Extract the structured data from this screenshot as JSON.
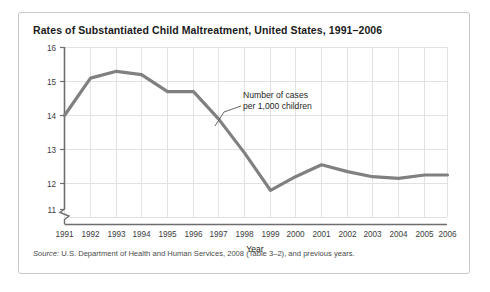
{
  "figure": {
    "title": "Rates of Substantiated Child Maltreatment, United States, 1991–2006",
    "source_label": "Source:",
    "source_text": " U.S. Department of Health and Human Services, 2008 (Table 3–2), and previous years.",
    "frame_color": "#c8c8c8",
    "background": "#ffffff"
  },
  "chart_data": {
    "type": "line",
    "title": "Rates of Substantiated Child Maltreatment, United States, 1991–2006",
    "xlabel": "Year",
    "ylabel": "",
    "categories": [
      "1991",
      "1992",
      "1993",
      "1994",
      "1995",
      "1996",
      "1997",
      "1998",
      "1999",
      "2000",
      "2001",
      "2002",
      "2003",
      "2004",
      "2005",
      "2006"
    ],
    "x": [
      1991,
      1992,
      1993,
      1994,
      1995,
      1996,
      1997,
      1998,
      1999,
      2000,
      2001,
      2002,
      2003,
      2004,
      2005,
      2006
    ],
    "values": [
      14.0,
      15.1,
      15.3,
      15.2,
      14.7,
      14.7,
      13.9,
      12.9,
      11.8,
      12.2,
      12.55,
      12.35,
      12.2,
      12.15,
      12.25,
      12.25
    ],
    "series": [
      {
        "name": "Number of cases per 1,000 children",
        "values": [
          14.0,
          15.1,
          15.3,
          15.2,
          14.7,
          14.7,
          13.9,
          12.9,
          11.8,
          12.2,
          12.55,
          12.35,
          12.2,
          12.15,
          12.25,
          12.25
        ],
        "color": "#808080"
      }
    ],
    "ylim": [
      11,
      16
    ],
    "yticks": [
      11,
      12,
      13,
      14,
      15,
      16
    ],
    "ytick_labels": [
      "11",
      "12",
      "13",
      "14",
      "15",
      "16"
    ],
    "xlim": [
      1991,
      2006
    ],
    "grid": true,
    "grid_color": "#e2e2e2",
    "legend": "none",
    "y_axis_break": true,
    "annotations": [
      {
        "line1": "Number of cases",
        "line2": "per 1,000 children",
        "points_to_year": 1997
      }
    ]
  }
}
